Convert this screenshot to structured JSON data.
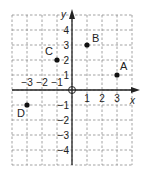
{
  "chart_data": {
    "type": "scatter",
    "title": "",
    "xlabel": "x",
    "ylabel": "y",
    "xlim": [
      -4,
      4
    ],
    "ylim": [
      -5,
      5
    ],
    "grid": true,
    "origin_label": "O",
    "x_ticks": [
      -3,
      -2,
      -1,
      1,
      2,
      3
    ],
    "y_ticks": [
      4,
      3,
      2,
      1,
      -1,
      -2,
      -3,
      -4
    ],
    "points": [
      {
        "label": "A",
        "x": 3,
        "y": 1
      },
      {
        "label": "B",
        "x": 1,
        "y": 3
      },
      {
        "label": "C",
        "x": -1,
        "y": 2
      },
      {
        "label": "D",
        "x": -3,
        "y": -1
      }
    ]
  }
}
